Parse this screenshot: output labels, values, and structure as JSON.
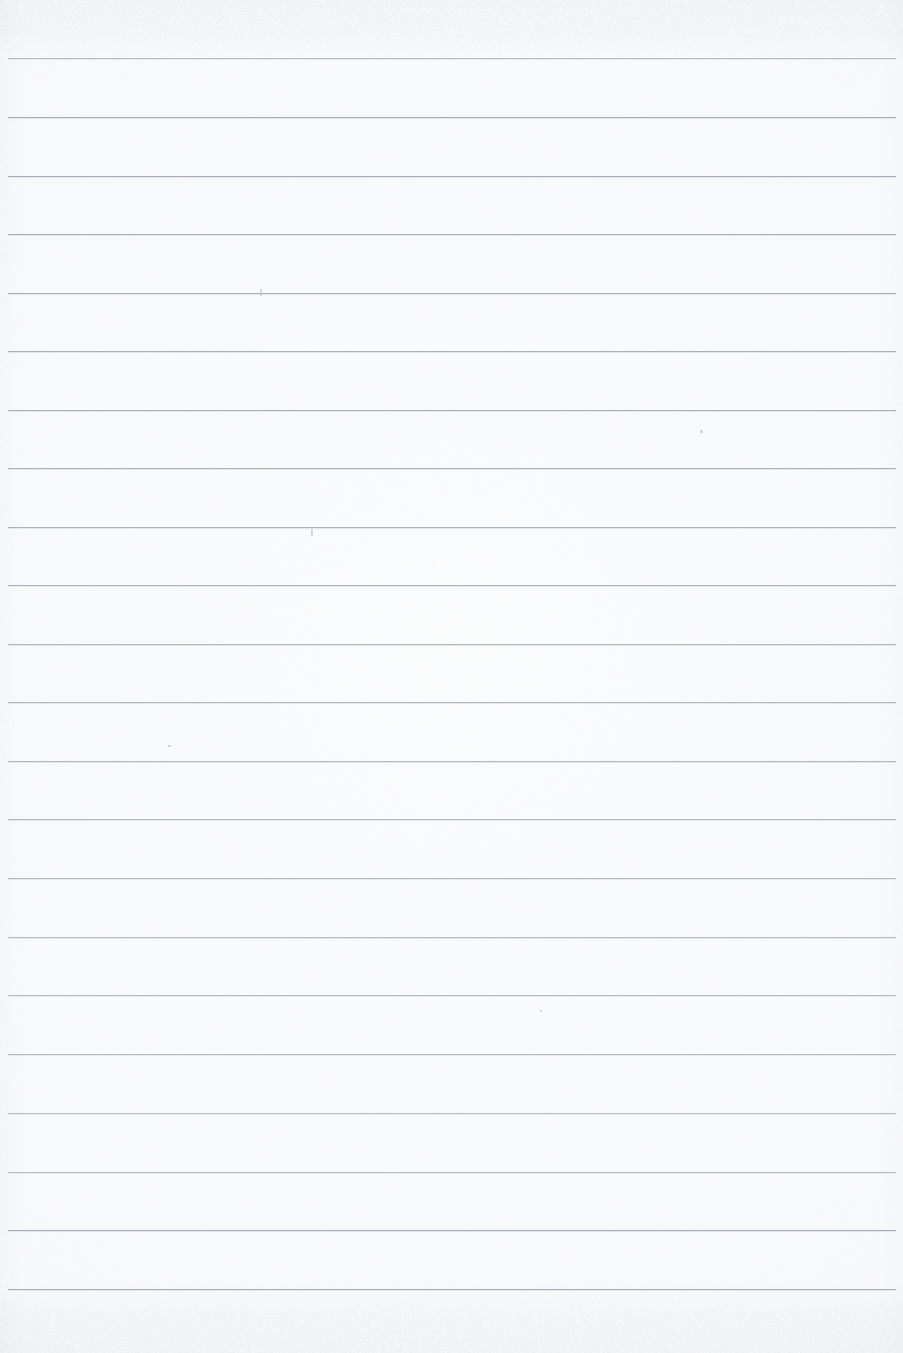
{
  "document": {
    "kind": "scanned-lined-notebook-page",
    "title": "Blank Ruled Notebook Page",
    "page_width_px": 903,
    "page_height_px": 1353,
    "content_text": "",
    "is_blank": true
  },
  "paper": {
    "background_color": "#ffffff",
    "base_tone_color": "#fdfdfe",
    "vignette_edge_color": "#f8f9fa",
    "grain_opacity": 0.42,
    "texture_note": "scanner grain with heavier mottling along top and bottom edges"
  },
  "ruling": {
    "line_color": "#a9acb0",
    "line_halo_color": "#e4e6e9",
    "line_thickness_px": 1,
    "line_spacing_px": 58.6,
    "first_line_y_px": 58,
    "line_start_x_px": 8,
    "line_end_x_px": 896,
    "line_count": 22,
    "line_y_positions": [
      58,
      117,
      176,
      234,
      293,
      351,
      410,
      468,
      527,
      585,
      644,
      702,
      761,
      819,
      878,
      937,
      995,
      1054,
      1113,
      1172,
      1230,
      1289
    ],
    "top_margin_px": 58,
    "bottom_margin_px": 64
  },
  "writing_rows": [
    {
      "index": 1,
      "text": ""
    },
    {
      "index": 2,
      "text": ""
    },
    {
      "index": 3,
      "text": ""
    },
    {
      "index": 4,
      "text": ""
    },
    {
      "index": 5,
      "text": ""
    },
    {
      "index": 6,
      "text": ""
    },
    {
      "index": 7,
      "text": ""
    },
    {
      "index": 8,
      "text": ""
    },
    {
      "index": 9,
      "text": ""
    },
    {
      "index": 10,
      "text": ""
    },
    {
      "index": 11,
      "text": ""
    },
    {
      "index": 12,
      "text": ""
    },
    {
      "index": 13,
      "text": ""
    },
    {
      "index": 14,
      "text": ""
    },
    {
      "index": 15,
      "text": ""
    },
    {
      "index": 16,
      "text": ""
    },
    {
      "index": 17,
      "text": ""
    },
    {
      "index": 18,
      "text": ""
    },
    {
      "index": 19,
      "text": ""
    },
    {
      "index": 20,
      "text": ""
    },
    {
      "index": 21,
      "text": ""
    },
    {
      "index": 22,
      "text": ""
    }
  ],
  "specks": [
    {
      "x": 260,
      "y": 289,
      "w": 2,
      "h": 7
    },
    {
      "x": 311,
      "y": 529,
      "w": 2,
      "h": 7
    },
    {
      "x": 700,
      "y": 430,
      "w": 3,
      "h": 3
    },
    {
      "x": 168,
      "y": 745,
      "w": 3,
      "h": 2
    },
    {
      "x": 540,
      "y": 1010,
      "w": 2,
      "h": 2
    }
  ]
}
